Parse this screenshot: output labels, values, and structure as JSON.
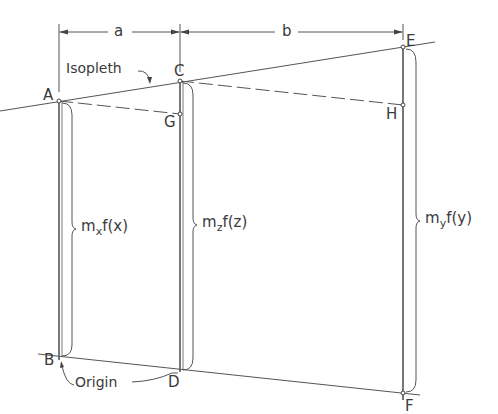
{
  "diagram": {
    "type": "nomograph-construction",
    "colors": {
      "line": "#555555",
      "text": "#3a3a3a",
      "background": "#ffffff"
    },
    "dimensions": {
      "a": "a",
      "b": "b"
    },
    "points": {
      "A": "A",
      "B": "B",
      "C": "C",
      "D": "D",
      "E": "E",
      "F": "F",
      "G": "G",
      "H": "H"
    },
    "annotations": {
      "isopleth": "Isopleth",
      "origin": "Origin"
    },
    "braces": {
      "x": {
        "m": "m",
        "sub": "x",
        "fn": "f(x)"
      },
      "z": {
        "m": "m",
        "sub": "z",
        "fn": "f(z)"
      },
      "y": {
        "m": "m",
        "sub": "y",
        "fn": "f(y)"
      }
    }
  }
}
